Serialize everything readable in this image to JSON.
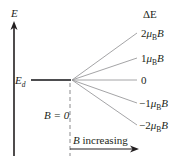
{
  "diagram": {
    "axis": {
      "label": "E",
      "direction": "up"
    },
    "initial_level": {
      "label_main": "E",
      "label_sub": "d"
    },
    "zero_field_label": "B = 0",
    "field_arrow_label_var": "B",
    "field_arrow_label_text": " increasing",
    "delta_header": "ΔE",
    "levels": [
      {
        "coef": "2",
        "unit_mu": "μ",
        "unit_sub": "B",
        "unit_B": "B",
        "y": 33
      },
      {
        "coef": "1",
        "unit_mu": "μ",
        "unit_sub": "B",
        "unit_B": "B",
        "y": 58
      },
      {
        "coef": "0",
        "unit_mu": "",
        "unit_sub": "",
        "unit_B": "",
        "y": 80
      },
      {
        "coef": "−1",
        "unit_mu": "μ",
        "unit_sub": "B",
        "unit_B": "B",
        "y": 103
      },
      {
        "coef": "−2",
        "unit_mu": "μ",
        "unit_sub": "B",
        "unit_B": "B",
        "y": 125
      }
    ],
    "colors": {
      "axis": "#231f20",
      "level_line": "#4d4d4f",
      "split_lines": "#9a9a9c",
      "dashed": "#8a8a8c",
      "text": "#231f20"
    }
  }
}
